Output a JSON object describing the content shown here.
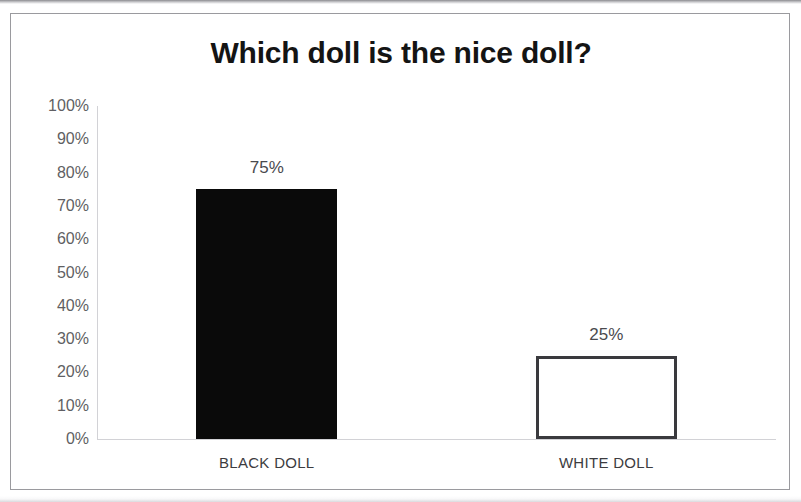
{
  "chart_data": {
    "type": "bar",
    "title": "Which doll is the nice doll?",
    "xlabel": "",
    "ylabel": "",
    "categories": [
      "BLACK DOLL",
      "WHITE DOLL"
    ],
    "values": [
      75,
      25
    ],
    "value_labels": [
      "75%",
      "25%"
    ],
    "ylim": [
      0,
      100
    ],
    "ytick_labels": [
      "100%",
      "90%",
      "80%",
      "70%",
      "60%",
      "50%",
      "40%",
      "30%",
      "20%",
      "10%",
      "0%"
    ],
    "ytick_values": [
      100,
      90,
      80,
      70,
      60,
      50,
      40,
      30,
      20,
      10,
      0
    ],
    "grid": false,
    "legend": false,
    "bar_styles": [
      {
        "name": "black-doll-bar",
        "fill": "#0a0a0a",
        "border": "none"
      },
      {
        "name": "white-doll-bar",
        "fill": "#ffffff",
        "border": "#3a3a3e"
      }
    ],
    "axis_color": "#d2d2d6",
    "tick_label_color": "#5f5f63",
    "title_color": "#141414",
    "frame_color": "#9a9a9e"
  }
}
